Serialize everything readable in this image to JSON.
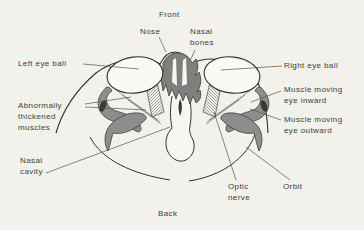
{
  "figure": {
    "type": "labeled anatomical line diagram (axial section through the orbits)",
    "orientation": {
      "top": "Front",
      "bottom": "Back"
    },
    "labels": {
      "front": "Front",
      "back": "Back",
      "nose": "Nose",
      "nasal_bones_1": "Nasal",
      "nasal_bones_2": "bones",
      "left_eye": "Left eye ball",
      "right_eye": "Right eye ball",
      "abnormal_1": "Abnormally",
      "abnormal_2": "thickened",
      "abnormal_3": "muscles",
      "inward_1": "Muscle moving",
      "inward_2": "eye inward",
      "outward_1": "Muscle moving",
      "outward_2": "eye outward",
      "nasal_cavity_1": "Nasal",
      "nasal_cavity_2": "cavity",
      "optic_1": "Optic",
      "optic_2": "nerve",
      "orbit": "Orbit"
    },
    "colors": {
      "background": "#f2f1ec",
      "line": "#33312e",
      "muscle_gray": "#8d8d8b",
      "bone_gray": "#7f7f7d",
      "paper_white": "#faf9f5",
      "text": "#403e3a",
      "leader_line": "#55534f"
    }
  }
}
